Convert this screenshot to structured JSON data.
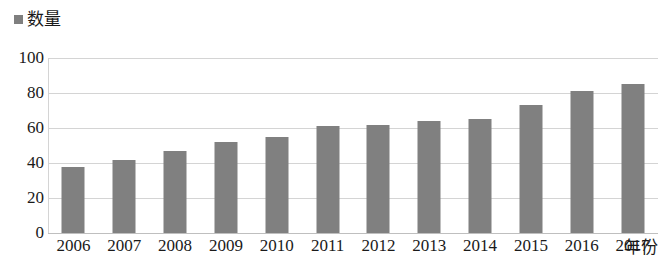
{
  "legend": {
    "marker_color": "#7f7f7f",
    "items": [
      {
        "label": "数量",
        "color": "#7f7f7f"
      }
    ]
  },
  "axes": {
    "x_title": "年份",
    "y_title": ""
  },
  "chart_data": {
    "type": "bar",
    "title": "",
    "subtitle": "",
    "xlabel": "年份",
    "ylabel": "",
    "categories": [
      "2006",
      "2007",
      "2008",
      "2009",
      "2010",
      "2011",
      "2012",
      "2013",
      "2014",
      "2015",
      "2016",
      "2017"
    ],
    "values": [
      38,
      42,
      47,
      52,
      55,
      61,
      62,
      64,
      65,
      73,
      81,
      85
    ],
    "series": [
      {
        "name": "数量",
        "color": "#808080",
        "values": [
          38,
          42,
          47,
          52,
          55,
          61,
          62,
          64,
          65,
          73,
          81,
          85
        ]
      }
    ],
    "ylim": [
      0,
      100
    ],
    "yticks": [
      0,
      20,
      40,
      60,
      80,
      100
    ],
    "ytick_labels": [
      "0",
      "20",
      "40",
      "60",
      "80",
      "100"
    ],
    "grid": true,
    "grid_axis": "y",
    "legend_position": "top-left",
    "bar_color": "#808080",
    "background": "#ffffff"
  }
}
